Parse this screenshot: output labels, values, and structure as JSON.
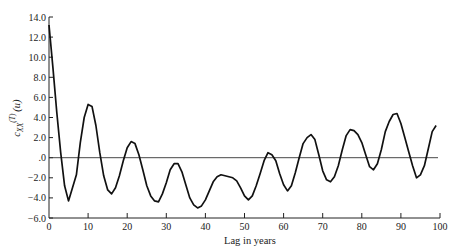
{
  "chart_data": {
    "type": "line",
    "title": "",
    "xlabel": "Lag in years",
    "ylabel": "c_XX^(T)(u)",
    "ylabel_parts": {
      "base": "c",
      "sub": "XX",
      "sup": "(T)",
      "arg": "(u)"
    },
    "xlim": [
      0,
      100
    ],
    "ylim": [
      -6.0,
      14.0
    ],
    "xticks": [
      0,
      10,
      20,
      30,
      40,
      50,
      60,
      70,
      80,
      90,
      100
    ],
    "xtick_labels": [
      "0",
      "10",
      "20",
      "30",
      "40",
      "50",
      "60",
      "70",
      "80",
      "90",
      "100"
    ],
    "yticks": [
      -6,
      -4,
      -2,
      0,
      2,
      4,
      6,
      8,
      10,
      12,
      14
    ],
    "ytick_labels": [
      "−6.0",
      "−4.0",
      "−2.0",
      ".0",
      "2.0",
      "4.0",
      "6.0",
      "8.0",
      "10.0",
      "12.0",
      "14.0"
    ],
    "grid": false,
    "legend": null,
    "reference_line": {
      "y": 0,
      "description": "horizontal zero line"
    },
    "series": [
      {
        "name": "autocovariance",
        "x": [
          0,
          1,
          2,
          3,
          4,
          5,
          6,
          7,
          8,
          9,
          10,
          11,
          12,
          13,
          14,
          15,
          16,
          17,
          18,
          19,
          20,
          21,
          22,
          23,
          24,
          25,
          26,
          27,
          28,
          29,
          30,
          31,
          32,
          33,
          34,
          35,
          36,
          37,
          38,
          39,
          40,
          41,
          42,
          43,
          44,
          45,
          46,
          47,
          48,
          49,
          50,
          51,
          52,
          53,
          54,
          55,
          56,
          57,
          58,
          59,
          60,
          61,
          62,
          63,
          64,
          65,
          66,
          67,
          68,
          69,
          70,
          71,
          72,
          73,
          74,
          75,
          76,
          77,
          78,
          79,
          80,
          81,
          82,
          83,
          84,
          85,
          86,
          87,
          88,
          89,
          90,
          91,
          92,
          93,
          94,
          95,
          96,
          97,
          98,
          99
        ],
        "values": [
          13.2,
          9.0,
          4.5,
          0.5,
          -2.8,
          -4.3,
          -3.0,
          -1.7,
          1.5,
          4.0,
          5.3,
          5.1,
          3.2,
          0.5,
          -1.8,
          -3.2,
          -3.6,
          -3.0,
          -1.8,
          -0.3,
          1.0,
          1.6,
          1.4,
          0.3,
          -1.2,
          -2.8,
          -3.8,
          -4.3,
          -4.4,
          -3.6,
          -2.5,
          -1.2,
          -0.6,
          -0.6,
          -1.4,
          -2.7,
          -4.0,
          -4.7,
          -5.0,
          -4.8,
          -4.2,
          -3.3,
          -2.4,
          -1.9,
          -1.7,
          -1.8,
          -1.9,
          -2.0,
          -2.3,
          -3.0,
          -3.8,
          -4.2,
          -3.8,
          -2.8,
          -1.6,
          -0.3,
          0.5,
          0.3,
          -0.3,
          -1.6,
          -2.7,
          -3.3,
          -2.8,
          -1.5,
          0.0,
          1.4,
          2.0,
          2.3,
          1.8,
          0.3,
          -1.3,
          -2.2,
          -2.4,
          -1.9,
          -0.8,
          0.8,
          2.2,
          2.8,
          2.7,
          2.3,
          1.5,
          0.3,
          -0.9,
          -1.2,
          -0.6,
          0.8,
          2.6,
          3.6,
          4.3,
          4.4,
          3.4,
          2.0,
          0.6,
          -0.8,
          -2.0,
          -1.7,
          -0.8,
          0.9,
          2.6,
          3.2
        ]
      }
    ]
  }
}
